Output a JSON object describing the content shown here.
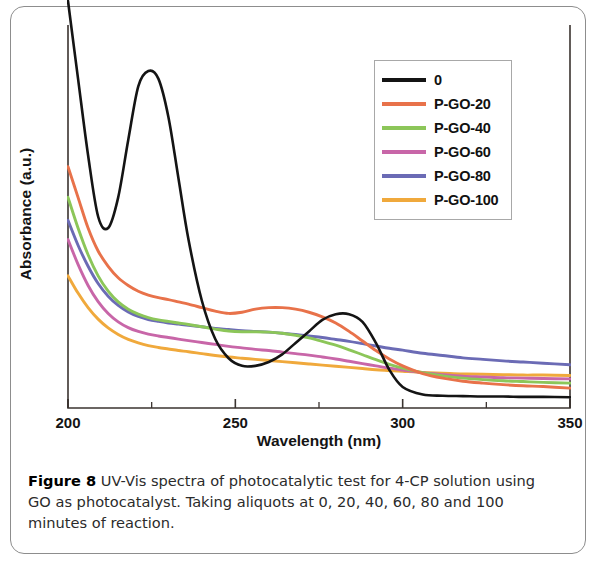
{
  "figure": {
    "caption_label": "Figure 8",
    "caption_text": " UV-Vis spectra of photocatalytic test for 4-CP solution using GO as photocatalyst. Taking aliquots at 0, 20, 40, 60, 80 and 100 minutes of reaction."
  },
  "legend": {
    "position": "top-right",
    "entries": [
      {
        "label": "0",
        "color": "#141414"
      },
      {
        "label": "P-GO-20",
        "color": "#e8724a"
      },
      {
        "label": "P-GO-40",
        "color": "#8cc659"
      },
      {
        "label": "P-GO-60",
        "color": "#c866a8"
      },
      {
        "label": "P-GO-80",
        "color": "#6b6bb5"
      },
      {
        "label": "P-GO-100",
        "color": "#f0a93c"
      }
    ]
  },
  "axes": {
    "x_title": "Wavelength (nm)",
    "y_title": "Absorbance (a.u.)",
    "x_ticks": [
      "200",
      "250",
      "300",
      "350"
    ],
    "y_ticks": []
  },
  "chart_data": {
    "type": "line",
    "title": "",
    "subtitle": "",
    "xlabel": "Wavelength (nm)",
    "ylabel": "Absorbance (a.u.)",
    "xlim": [
      200,
      350
    ],
    "ylim": [
      0,
      1
    ],
    "x_ticks": [
      200,
      250,
      300,
      350
    ],
    "x_minor_tick_step": 25,
    "y_tick_labels_shown": false,
    "grid": false,
    "legend_position": "top-right",
    "annotations": [],
    "x": [
      200,
      203,
      206,
      209,
      212,
      215,
      218,
      221,
      224,
      227,
      230,
      233,
      236,
      240,
      244,
      248,
      252,
      256,
      260,
      264,
      268,
      272,
      276,
      280,
      284,
      288,
      292,
      296,
      300,
      306,
      312,
      318,
      324,
      330,
      336,
      342,
      350
    ],
    "series": [
      {
        "name": "0",
        "color": "#141414",
        "values": [
          1.0,
          0.86,
          0.66,
          0.5,
          0.47,
          0.55,
          0.7,
          0.84,
          0.88,
          0.86,
          0.76,
          0.6,
          0.44,
          0.28,
          0.18,
          0.13,
          0.11,
          0.11,
          0.12,
          0.14,
          0.17,
          0.2,
          0.23,
          0.245,
          0.245,
          0.225,
          0.17,
          0.1,
          0.055,
          0.035,
          0.032,
          0.031,
          0.03,
          0.03,
          0.029,
          0.029,
          0.028
        ]
      },
      {
        "name": "P-GO-20",
        "color": "#e8724a",
        "values": [
          0.63,
          0.55,
          0.47,
          0.41,
          0.37,
          0.34,
          0.32,
          0.305,
          0.295,
          0.288,
          0.283,
          0.277,
          0.271,
          0.262,
          0.253,
          0.247,
          0.25,
          0.258,
          0.262,
          0.262,
          0.258,
          0.25,
          0.238,
          0.222,
          0.2,
          0.175,
          0.15,
          0.128,
          0.11,
          0.09,
          0.078,
          0.07,
          0.065,
          0.061,
          0.058,
          0.056,
          0.052
        ]
      },
      {
        "name": "P-GO-40",
        "color": "#8cc659",
        "values": [
          0.55,
          0.47,
          0.4,
          0.345,
          0.305,
          0.277,
          0.258,
          0.245,
          0.236,
          0.23,
          0.226,
          0.222,
          0.218,
          0.212,
          0.206,
          0.201,
          0.199,
          0.199,
          0.198,
          0.195,
          0.19,
          0.183,
          0.174,
          0.164,
          0.152,
          0.139,
          0.126,
          0.114,
          0.104,
          0.092,
          0.084,
          0.078,
          0.074,
          0.071,
          0.069,
          0.067,
          0.065
        ]
      },
      {
        "name": "P-GO-60",
        "color": "#c866a8",
        "values": [
          0.44,
          0.375,
          0.32,
          0.278,
          0.247,
          0.225,
          0.21,
          0.2,
          0.193,
          0.188,
          0.184,
          0.18,
          0.176,
          0.171,
          0.166,
          0.161,
          0.157,
          0.153,
          0.15,
          0.146,
          0.142,
          0.138,
          0.133,
          0.128,
          0.122,
          0.116,
          0.11,
          0.104,
          0.099,
          0.092,
          0.087,
          0.083,
          0.081,
          0.079,
          0.078,
          0.077,
          0.076
        ]
      },
      {
        "name": "P-GO-80",
        "color": "#6b6bb5",
        "values": [
          0.49,
          0.425,
          0.37,
          0.325,
          0.292,
          0.268,
          0.251,
          0.239,
          0.231,
          0.226,
          0.222,
          0.219,
          0.216,
          0.212,
          0.208,
          0.205,
          0.202,
          0.2,
          0.198,
          0.195,
          0.192,
          0.188,
          0.184,
          0.179,
          0.174,
          0.168,
          0.162,
          0.156,
          0.151,
          0.143,
          0.137,
          0.131,
          0.127,
          0.123,
          0.12,
          0.117,
          0.113
        ]
      },
      {
        "name": "P-GO-100",
        "color": "#f0a93c",
        "values": [
          0.345,
          0.3,
          0.262,
          0.232,
          0.209,
          0.192,
          0.179,
          0.17,
          0.163,
          0.158,
          0.154,
          0.15,
          0.147,
          0.142,
          0.137,
          0.133,
          0.13,
          0.127,
          0.124,
          0.121,
          0.118,
          0.115,
          0.112,
          0.109,
          0.106,
          0.103,
          0.1,
          0.098,
          0.096,
          0.093,
          0.091,
          0.089,
          0.088,
          0.087,
          0.086,
          0.086,
          0.085
        ]
      }
    ]
  }
}
